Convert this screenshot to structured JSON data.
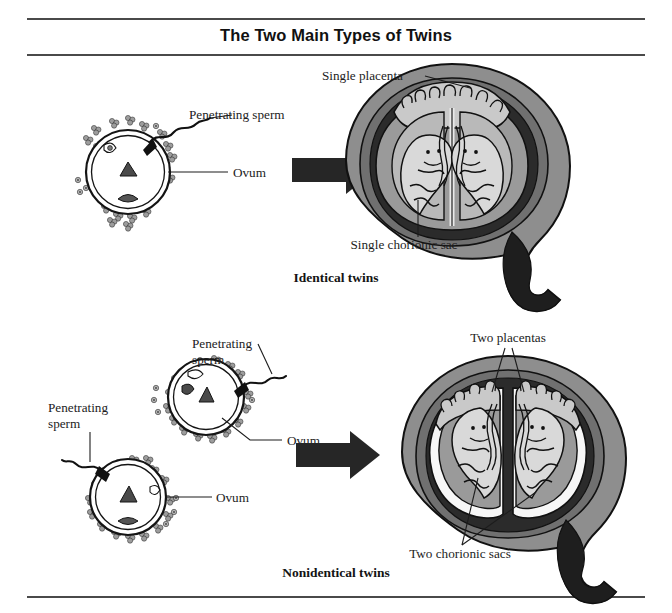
{
  "figure": {
    "title": "The Two Main Types of Twins",
    "type": "scientific-illustration-diagram",
    "background_color": "#ffffff",
    "rule_color": "#4a4a4a"
  },
  "palette": {
    "uterus_wall_outer": "#8e8e8e",
    "uterus_wall_inner": "#707070",
    "myometrium_dark": "#2e2e2e",
    "cavity_dark": "#262626",
    "chorion_mid": "#9a9a9a",
    "amnion_light": "#b9b9b9",
    "fetus_fill": "#d9d9d9",
    "membrane_white": "#f7f7f7",
    "placenta_fill": "#c9c9c9",
    "outline": "#111111",
    "arrow_fill": "#262626",
    "ovum_fill": "#ffffff",
    "sperm_fill": "#9d9d9d"
  },
  "panels": [
    {
      "id": "identical",
      "caption": "Identical twins",
      "left_stage": {
        "name": "single-fertilized-ovum",
        "ova_count": 1,
        "labels": [
          {
            "id": "penetrating-sperm",
            "text": "Penetrating sperm",
            "lines": [
              "Penetrating sperm"
            ]
          },
          {
            "id": "ovum",
            "text": "Ovum",
            "lines": [
              "Ovum"
            ]
          }
        ]
      },
      "arrow": {
        "name": "transition-arrow",
        "direction": "right"
      },
      "right_stage": {
        "name": "uterus-with-identical-twins",
        "fetus_count": 2,
        "placenta_count": 1,
        "chorionic_sac_count": 1,
        "labels": [
          {
            "id": "single-placenta",
            "text": "Single placenta",
            "lines": [
              "Single placenta"
            ]
          },
          {
            "id": "single-chorionic-sac",
            "text": "Single chorionic sac",
            "lines": [
              "Single chorionic sac"
            ]
          }
        ]
      }
    },
    {
      "id": "nonidentical",
      "caption": "Nonidentical twins",
      "left_stage": {
        "name": "two-fertilized-ova",
        "ova_count": 2,
        "labels": [
          {
            "id": "penetrating-sperm-upper",
            "text": "Penetrating sperm",
            "lines": [
              "Penetrating",
              "sperm"
            ]
          },
          {
            "id": "ovum-upper",
            "text": "Ovum",
            "lines": [
              "Ovum"
            ]
          },
          {
            "id": "penetrating-sperm-lower",
            "text": "Penetrating sperm",
            "lines": [
              "Penetrating",
              "sperm"
            ]
          },
          {
            "id": "ovum-lower",
            "text": "Ovum",
            "lines": [
              "Ovum"
            ]
          }
        ]
      },
      "arrow": {
        "name": "transition-arrow",
        "direction": "right"
      },
      "right_stage": {
        "name": "uterus-with-nonidentical-twins",
        "fetus_count": 2,
        "placenta_count": 2,
        "chorionic_sac_count": 2,
        "labels": [
          {
            "id": "two-placentas",
            "text": "Two placentas",
            "lines": [
              "Two placentas"
            ]
          },
          {
            "id": "two-chorionic-sacs",
            "text": "Two chorionic sacs",
            "lines": [
              "Two chorionic sacs"
            ]
          }
        ]
      }
    }
  ]
}
